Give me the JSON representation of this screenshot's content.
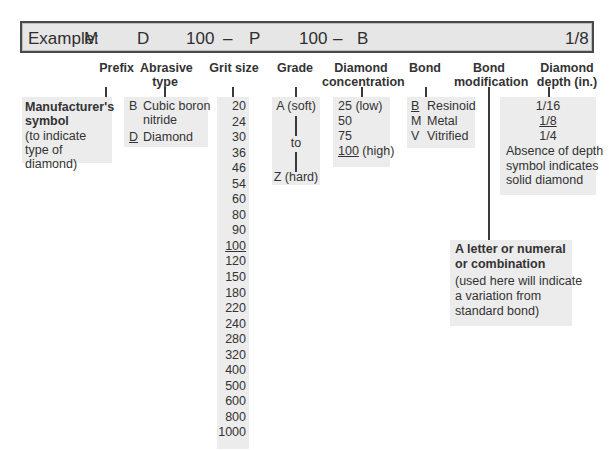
{
  "example": {
    "label": "Example:",
    "parts": [
      {
        "key": "prefix",
        "value": "M"
      },
      {
        "key": "abrasive",
        "value": "D"
      },
      {
        "key": "grit",
        "value": "100"
      },
      {
        "key": "dash1",
        "value": "–"
      },
      {
        "key": "grade",
        "value": "P"
      },
      {
        "key": "concentration",
        "value": "100"
      },
      {
        "key": "dash2",
        "value": "–"
      },
      {
        "key": "bond",
        "value": "B"
      },
      {
        "key": "depth",
        "value": "1/8"
      }
    ]
  },
  "columns": {
    "prefix": {
      "title": "Prefix",
      "heading": "Manufacturer's symbol",
      "note": "(to indicate type of diamond)"
    },
    "abrasive": {
      "title_line1": "Abrasive",
      "title_line2": "type",
      "items": [
        {
          "code": "B",
          "label": "Cubic boron",
          "label2": "nitride",
          "underlined": false
        },
        {
          "code": "D",
          "label": "Diamond",
          "underlined": true
        }
      ]
    },
    "grit": {
      "title": "Grit size",
      "values": [
        "20",
        "24",
        "30",
        "36",
        "46",
        "54",
        "60",
        "80",
        "90",
        "100",
        "120",
        "150",
        "180",
        "220",
        "240",
        "280",
        "320",
        "400",
        "500",
        "600",
        "800",
        "1000"
      ],
      "selected": "100"
    },
    "grade": {
      "title": "Grade",
      "top": "A (soft)",
      "middle": "to",
      "bottom": "Z (hard)"
    },
    "concentration": {
      "title_line1": "Diamond",
      "title_line2": "concentration",
      "items": [
        {
          "value": "25",
          "note": "(low)",
          "underlined": false
        },
        {
          "value": "50",
          "note": "",
          "underlined": false
        },
        {
          "value": "75",
          "note": "",
          "underlined": false
        },
        {
          "value": "100",
          "note": "(high)",
          "underlined": true
        }
      ]
    },
    "bond": {
      "title": "Bond",
      "items": [
        {
          "code": "B",
          "label": "Resinoid",
          "underlined": true
        },
        {
          "code": "M",
          "label": "Metal",
          "underlined": false
        },
        {
          "code": "V",
          "label": "Vitrified",
          "underlined": false
        }
      ]
    },
    "bond_modification": {
      "title_line1": "Bond",
      "title_line2": "modification",
      "heading_line1": "A letter or numeral",
      "heading_line2": "or combination",
      "note_line1": "(used here will indicate",
      "note_line2": "a variation from",
      "note_line3": "standard bond)"
    },
    "depth": {
      "title_line1": "Diamond",
      "title_line2": "depth (in.)",
      "values": [
        {
          "value": "1/16",
          "underlined": false
        },
        {
          "value": "1/8",
          "underlined": true
        },
        {
          "value": "1/4",
          "underlined": false
        }
      ],
      "note_line1": "Absence of depth",
      "note_line2": "symbol indicates",
      "note_line3": "solid diamond"
    }
  }
}
